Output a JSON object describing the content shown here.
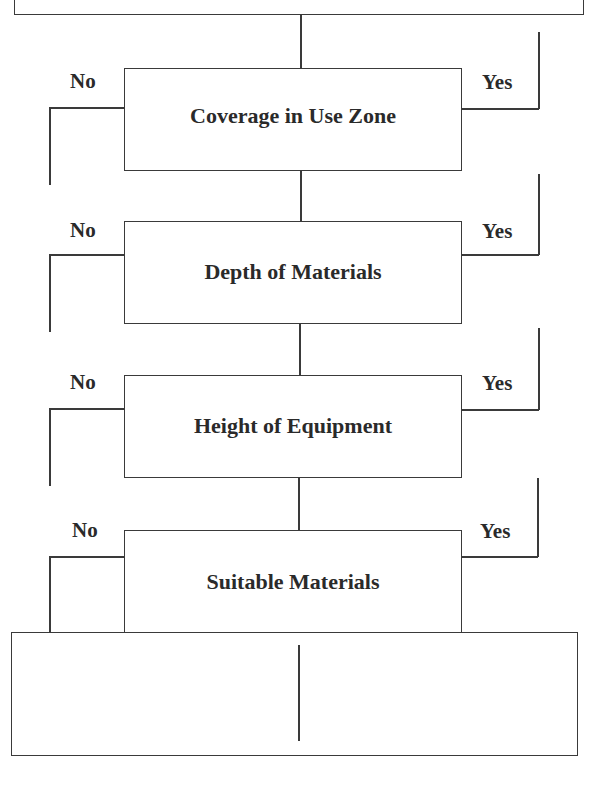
{
  "flowchart": {
    "steps": [
      {
        "label": "Coverage in Use Zone",
        "no": "No",
        "yes": "Yes"
      },
      {
        "label": "Depth of Materials",
        "no": "No",
        "yes": "Yes"
      },
      {
        "label": "Height of Equipment",
        "no": "No",
        "yes": "Yes"
      },
      {
        "label": "Suitable Materials",
        "no": "No",
        "yes": "Yes"
      }
    ]
  }
}
